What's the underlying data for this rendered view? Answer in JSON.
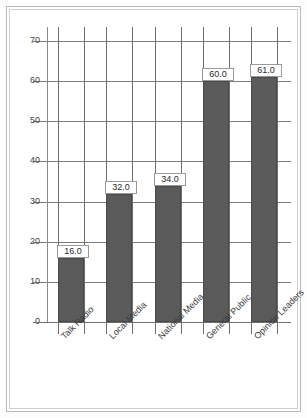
{
  "chart_data": {
    "type": "bar",
    "title": "",
    "xlabel": "",
    "ylabel": "",
    "categories": [
      "Talk Radio",
      "Local Media",
      "National Media",
      "General Public",
      "Opinion Leaders"
    ],
    "values": [
      16.0,
      32.0,
      34.0,
      60.0,
      61.0
    ],
    "value_labels": [
      "16.0",
      "32.0",
      "34.0",
      "60.0",
      "61.0"
    ],
    "ylim": [
      0,
      74
    ],
    "yticks": [
      0,
      10,
      20,
      30,
      40,
      50,
      60,
      70
    ],
    "ytick_labels": [
      "0",
      "10",
      "20",
      "30",
      "40",
      "50",
      "60",
      "70"
    ],
    "grid": true,
    "grid_orientation": "both",
    "legend": false,
    "legend_position": "none",
    "bar_color": "#5a5a5a",
    "bar_edge_color": "#4a4a4a",
    "grid_color": "#7d7d7d",
    "axis_color": "#6e6e6e",
    "label_rotation": -45,
    "label_box_background": "#ffffff",
    "label_box_border": "#9a9a9a"
  },
  "frame": {
    "outer_border_color": "#b9b9b9",
    "inner_border_color": "#cfcfcf",
    "background": "#ffffff"
  }
}
